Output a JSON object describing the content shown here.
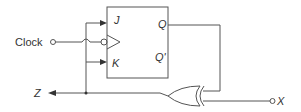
{
  "diagram": {
    "type": "sequential-circuit",
    "flip_flop": {
      "type": "JK flip-flop",
      "inputs": [
        "J",
        "K"
      ],
      "outputs": [
        "Q",
        "Q'"
      ],
      "clock": "negative-edge (bubble)"
    },
    "labels": {
      "clock": "Clock",
      "j": "J",
      "k": "K",
      "q": "Q",
      "q_bar": "Q'",
      "z": "Z",
      "x": "X"
    },
    "gate": "XOR",
    "connections": [
      "Q -> XOR input 1",
      "X -> XOR input 2",
      "XOR output -> Z",
      "Z -> J",
      "Z -> K"
    ],
    "colors": {
      "line": "#555555",
      "text": "#333333"
    }
  }
}
